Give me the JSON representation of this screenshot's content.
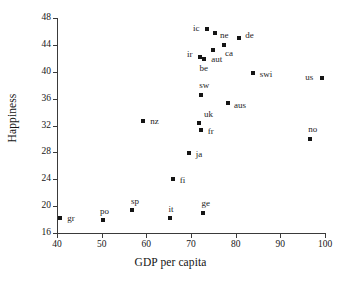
{
  "chart_data": {
    "type": "scatter",
    "title": "",
    "xlabel": "GDP per capita",
    "ylabel": "Happiness",
    "xlim": [
      40,
      100
    ],
    "ylim": [
      16,
      48
    ],
    "xticks": [
      40,
      50,
      60,
      70,
      80,
      90,
      100
    ],
    "yticks": [
      16,
      20,
      24,
      28,
      32,
      36,
      40,
      44,
      48
    ],
    "grid": false,
    "legend": "none",
    "marker": "filled-square",
    "marker_color": "#151515",
    "points": [
      {
        "label": "gr",
        "x": 40.7,
        "y": 18.2,
        "label_dx": 7,
        "label_dy": -4
      },
      {
        "label": "po",
        "x": 50.3,
        "y": 18.0,
        "label_dx": -3,
        "label_dy": -13
      },
      {
        "label": "sp",
        "x": 56.8,
        "y": 19.4,
        "label_dx": -1,
        "label_dy": -13
      },
      {
        "label": "nz",
        "x": 59.3,
        "y": 32.7,
        "label_dx": 7,
        "label_dy": -4
      },
      {
        "label": "it",
        "x": 65.4,
        "y": 18.2,
        "label_dx": -2,
        "label_dy": -13
      },
      {
        "label": "fi",
        "x": 65.9,
        "y": 24.1,
        "label_dx": 7,
        "label_dy": -3
      },
      {
        "label": "ja",
        "x": 69.5,
        "y": 27.9,
        "label_dx": 7,
        "label_dy": -3
      },
      {
        "label": "ge",
        "x": 72.6,
        "y": 19.0,
        "label_dx": -1,
        "label_dy": -14
      },
      {
        "label": "uk",
        "x": 71.8,
        "y": 32.3,
        "label_dx": 5,
        "label_dy": -13
      },
      {
        "label": "fr",
        "x": 72.2,
        "y": 31.3,
        "label_dx": 7,
        "label_dy": -3
      },
      {
        "label": "sw",
        "x": 72.3,
        "y": 36.6,
        "label_dx": -2,
        "label_dy": -14
      },
      {
        "label": "ir",
        "x": 72.0,
        "y": 42.2,
        "label_dx": -13,
        "label_dy": -7
      },
      {
        "label": "be",
        "x": 72.8,
        "y": 41.9,
        "label_dx": -4,
        "label_dy": 5
      },
      {
        "label": "ic",
        "x": 73.6,
        "y": 46.4,
        "label_dx": -14,
        "label_dy": -5
      },
      {
        "label": "aut",
        "x": 75.0,
        "y": 43.3,
        "label_dx": -2,
        "label_dy": 5
      },
      {
        "label": "ne",
        "x": 75.4,
        "y": 45.8,
        "label_dx": 5,
        "label_dy": -2
      },
      {
        "label": "ca",
        "x": 77.4,
        "y": 44.0,
        "label_dx": 1,
        "label_dy": 4
      },
      {
        "label": "aus",
        "x": 78.3,
        "y": 35.4,
        "label_dx": 6,
        "label_dy": -2
      },
      {
        "label": "de",
        "x": 80.8,
        "y": 45.0,
        "label_dx": 6,
        "label_dy": -7
      },
      {
        "label": "swi",
        "x": 83.8,
        "y": 39.8,
        "label_dx": 7,
        "label_dy": -3
      },
      {
        "label": "no",
        "x": 96.7,
        "y": 30.0,
        "label_dx": -2,
        "label_dy": -14
      },
      {
        "label": "us",
        "x": 99.4,
        "y": 39.1,
        "label_dx": -17,
        "label_dy": -5
      }
    ]
  }
}
